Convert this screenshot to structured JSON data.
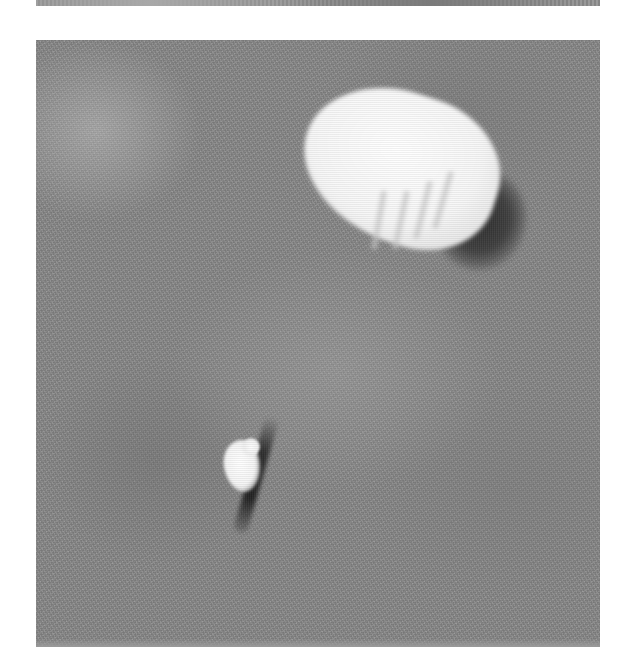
{
  "image": {
    "kind": "grayscale halftone photograph",
    "subject": "parachute canopy and parachutist seen from above against mottled ground",
    "elements": [
      {
        "name": "parachute-canopy",
        "description": "bright white canopy with gore lines, upper right",
        "color": "#f7f7f7"
      },
      {
        "name": "canopy-shadow",
        "description": "dark shadow beneath canopy",
        "color": "#2f2f2f"
      },
      {
        "name": "parachutist",
        "description": "small white figure, lower left",
        "color": "#f4f4f4"
      },
      {
        "name": "parachutist-shadow",
        "description": "elongated dark shadow next to the figure",
        "color": "#222222"
      }
    ],
    "background_color": "#8a8a8a",
    "page_color": "#ffffff"
  }
}
